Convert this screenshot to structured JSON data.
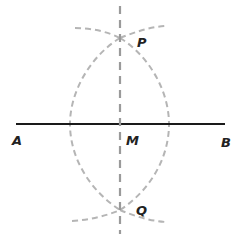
{
  "diagram": {
    "segment": {
      "start_label": "A",
      "end_label": "B"
    },
    "points": {
      "A": "A",
      "B": "B",
      "M": "M",
      "P": "P",
      "Q": "Q"
    },
    "colors": {
      "segment": "#1a1a1a",
      "construction_arcs": "#b5b5b5",
      "bisector": "#9a9a9a",
      "labels": "#222222"
    }
  }
}
